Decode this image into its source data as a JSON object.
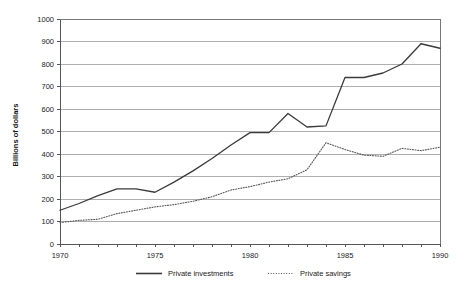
{
  "chart_data": {
    "type": "line",
    "title": "",
    "xlabel": "",
    "ylabel": "Billions of dollars",
    "xlim": [
      1970,
      1990
    ],
    "ylim": [
      0,
      1000
    ],
    "grid": true,
    "legend_position": "bottom",
    "x": [
      1970,
      1971,
      1972,
      1973,
      1974,
      1975,
      1976,
      1977,
      1978,
      1979,
      1980,
      1981,
      1982,
      1983,
      1984,
      1985,
      1986,
      1987,
      1988,
      1989,
      1990
    ],
    "x_tick_labels": [
      "1970",
      "1975",
      "1980",
      "1985",
      "1990"
    ],
    "x_tick_values": [
      1970,
      1975,
      1980,
      1985,
      1990
    ],
    "y_tick_labels": [
      "0",
      "100",
      "200",
      "300",
      "400",
      "500",
      "600",
      "700",
      "800",
      "900",
      "1000"
    ],
    "y_tick_values": [
      0,
      100,
      200,
      300,
      400,
      500,
      600,
      700,
      800,
      900,
      1000
    ],
    "series": [
      {
        "name": "Private investments",
        "style": "solid",
        "color": "#3a3a3a",
        "values": [
          150,
          180,
          215,
          245,
          245,
          230,
          275,
          325,
          380,
          440,
          495,
          495,
          580,
          520,
          525,
          740,
          740,
          760,
          800,
          890,
          870
        ]
      },
      {
        "name": "Private savings",
        "style": "dotted",
        "color": "#555555",
        "values": [
          95,
          105,
          110,
          135,
          150,
          165,
          175,
          190,
          210,
          240,
          255,
          275,
          290,
          330,
          450,
          420,
          395,
          390,
          425,
          415,
          430
        ]
      }
    ]
  },
  "legend": {
    "items": [
      {
        "label": "Private investments",
        "style": "solid"
      },
      {
        "label": "Private savings",
        "style": "dotted"
      }
    ]
  },
  "axis": {
    "y_title": "Billions of dollars"
  }
}
